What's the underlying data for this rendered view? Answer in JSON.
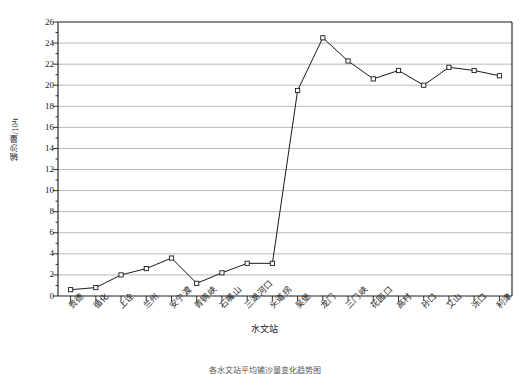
{
  "chart_data": {
    "type": "line",
    "title": "",
    "xlabel": "水文站",
    "ylabel": "输沙量/10⁴t",
    "ylim": [
      0,
      26
    ],
    "ytick_step": 2,
    "grid": true,
    "legend": "none",
    "marker": "open-square",
    "line_color": "#1a1a1a",
    "grid_color": "#999999",
    "categories": [
      "贵德",
      "循化",
      "上诠",
      "兰州",
      "安宁渡",
      "青铜峡",
      "石嘴山",
      "三湖河口",
      "头道拐",
      "吴堡",
      "龙门",
      "三门峡",
      "花园口",
      "高村",
      "孙口",
      "艾山",
      "泺口",
      "利津"
    ],
    "values": [
      0.6,
      0.8,
      2.0,
      2.6,
      3.6,
      1.2,
      2.2,
      3.1,
      3.1,
      19.5,
      24.5,
      22.3,
      20.6,
      21.4,
      20.0,
      21.7,
      21.4,
      20.9
    ],
    "ytick_labels": [
      "0",
      "2",
      "4",
      "6",
      "8",
      "10",
      "12",
      "14",
      "16",
      "18",
      "20",
      "22",
      "24",
      "26"
    ],
    "series": [
      {
        "name": "输沙量",
        "values": [
          0.6,
          0.8,
          2.0,
          2.6,
          3.6,
          1.2,
          2.2,
          3.1,
          3.1,
          19.5,
          24.5,
          22.3,
          20.6,
          21.4,
          20.0,
          21.7,
          21.4,
          20.9
        ]
      }
    ]
  },
  "caption": "各水文站平均输沙量变化趋势图"
}
